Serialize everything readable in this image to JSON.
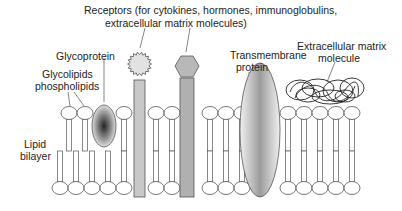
{
  "labels": {
    "receptors_line1": "Receptors (for cytokines, hormones, immunoglobulins,",
    "receptors_line2": "extracellular matrix molecules)",
    "glycoprotein": "Glycoprotein",
    "glycolipids_line1": "Glycolipids",
    "glycolipids_line2": "phospholipids",
    "lipid_line1": "Lipid",
    "lipid_line2": "bilayer",
    "transmembrane_line1": "Transmembrane",
    "transmembrane_line2": "protein",
    "ecm_line1": "Extracellular matrix",
    "ecm_line2": "molecule"
  },
  "colors": {
    "stroke": "#555555",
    "receptor_fill": "#c8c8c8",
    "receptor2_fill": "#b0b0b0",
    "text": "#222222"
  }
}
